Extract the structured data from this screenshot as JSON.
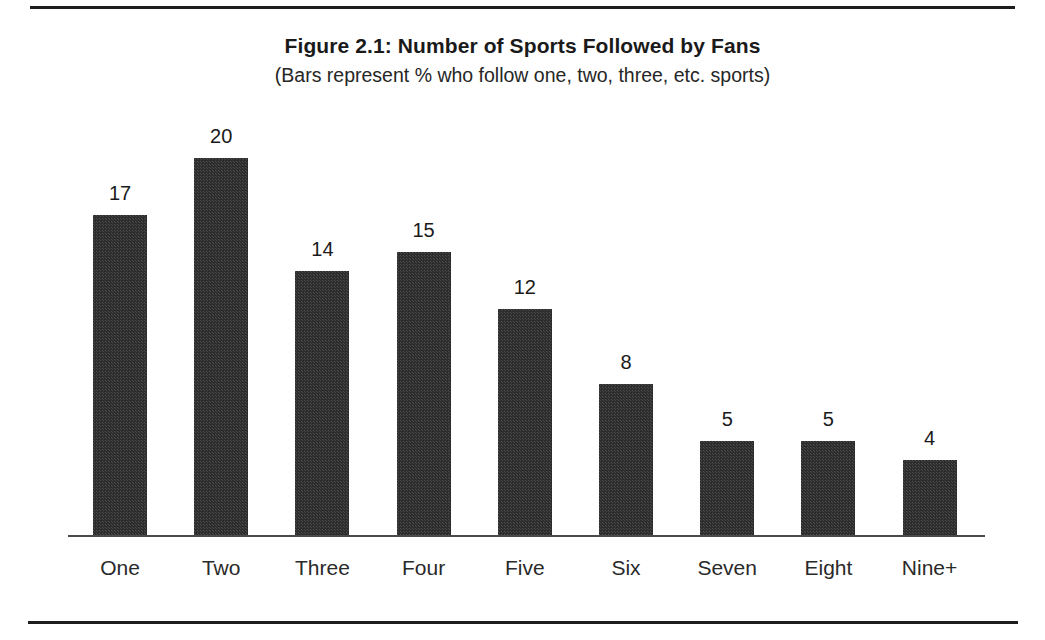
{
  "figure": {
    "title": "Figure 2.1: Number of Sports Followed by Fans",
    "subtitle": "(Bars represent % who follow one, two, three, etc. sports)"
  },
  "colors": {
    "bar_fill": "#2d2d2d",
    "axis": "#4a4a4a",
    "rule": "#1d1d1d",
    "text": "#1a1a1a",
    "background": "#ffffff"
  },
  "chart_data": {
    "type": "bar",
    "title": "Figure 2.1: Number of Sports Followed by Fans",
    "subtitle": "(Bars represent % who follow one, two, three, etc. sports)",
    "xlabel": "",
    "ylabel": "",
    "ylim": [
      0,
      20
    ],
    "grid": false,
    "legend": "none",
    "value_labels": true,
    "value_suffix": "%",
    "categories": [
      "One",
      "Two",
      "Three",
      "Four",
      "Five",
      "Six",
      "Seven",
      "Eight",
      "Nine+"
    ],
    "values": [
      17,
      20,
      14,
      15,
      12,
      8,
      5,
      5,
      4
    ],
    "bars": [
      {
        "category": "One",
        "value": 17,
        "label": "17"
      },
      {
        "category": "Two",
        "value": 20,
        "label": "20"
      },
      {
        "category": "Three",
        "value": 14,
        "label": "14"
      },
      {
        "category": "Four",
        "value": 15,
        "label": "15"
      },
      {
        "category": "Five",
        "value": 12,
        "label": "12"
      },
      {
        "category": "Six",
        "value": 8,
        "label": "8"
      },
      {
        "category": "Seven",
        "value": 5,
        "label": "5"
      },
      {
        "category": "Eight",
        "value": 5,
        "label": "5"
      },
      {
        "category": "Nine+",
        "value": 4,
        "label": "4"
      }
    ]
  },
  "layout": {
    "baseline_y": 535,
    "bar_width": 54,
    "bar_pitch": 101.2,
    "first_bar_left": 93,
    "px_per_unit": 18.85,
    "label_y": 556
  }
}
